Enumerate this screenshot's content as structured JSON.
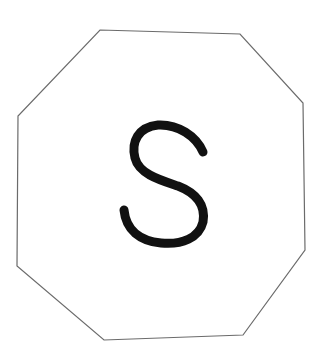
{
  "figure": {
    "shape": "octagon",
    "letter": "S",
    "outline_color": "#6b6b6b",
    "letter_color": "#111111",
    "background": "#ffffff"
  }
}
